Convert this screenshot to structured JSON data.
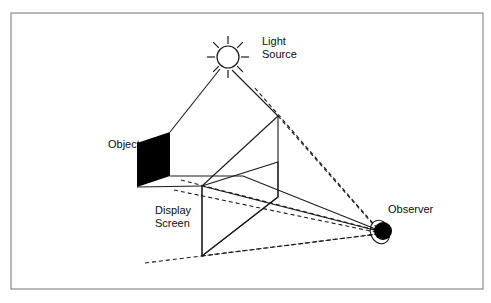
{
  "figure": {
    "background_color": "#ffffff",
    "border_color": "#8a8a8a",
    "line_color": "#1a1a1a",
    "fill_color": "#000000",
    "border": {
      "x": 11,
      "y": 13,
      "width": 472,
      "height": 276
    },
    "labels": {
      "light_source_line1": "Light",
      "light_source_line2": "Source",
      "object": "Object",
      "display_screen_line1": "Display",
      "display_screen_line2": "Screen",
      "observer": "Observer"
    },
    "elements": {
      "light_source": {
        "name": "sun-icon",
        "center_x": 228,
        "center_y": 57,
        "radius": 11,
        "ray_count": 8,
        "ray_inner": 13,
        "ray_outer": 21
      },
      "observer_eye": {
        "name": "observer-eye-icon",
        "pupil_cx": 383,
        "pupil_cy": 231,
        "pupil_r": 9,
        "ring_cx": 380,
        "ring_cy": 232,
        "ring_rx": 9.5,
        "ring_ry": 12
      },
      "object_panel": {
        "name": "object-panel",
        "points": "137,143 170,132 170,176 137,187"
      },
      "display_screen": {
        "name": "display-screen-outline",
        "points": "202,186 278,162 278,197 202,256"
      }
    },
    "solid_lines": [
      {
        "name": "light-ray-to-object",
        "x1": 220,
        "y1": 69,
        "x2": 170,
        "y2": 132
      },
      {
        "name": "light-ray-to-apex",
        "x1": 232,
        "y1": 70,
        "x2": 278,
        "y2": 116
      },
      {
        "name": "object-top-edge-to-screen",
        "x1": 170,
        "y1": 176,
        "x2": 243,
        "y2": 176
      },
      {
        "name": "object-bottom-edge-to-screen",
        "x1": 137,
        "y1": 187,
        "x2": 202,
        "y2": 186
      },
      {
        "name": "apex-vertical-edge",
        "x1": 278,
        "y1": 116,
        "x2": 278,
        "y2": 197
      },
      {
        "name": "screen-left-vertical-edge",
        "x1": 202,
        "y1": 186,
        "x2": 202,
        "y2": 256
      },
      {
        "name": "apex-to-screen-left-top",
        "x1": 278,
        "y1": 116,
        "x2": 202,
        "y2": 186
      },
      {
        "name": "apex-to-screen-bottom-left",
        "x1": 278,
        "y1": 197,
        "x2": 202,
        "y2": 256
      },
      {
        "name": "shadow-top-to-observer",
        "x1": 202,
        "y1": 186,
        "x2": 378,
        "y2": 231
      },
      {
        "name": "screen-top-edge-to-observer",
        "x1": 243,
        "y1": 176,
        "x2": 378,
        "y2": 230
      }
    ],
    "dashed_lines": [
      {
        "name": "sight-line-upper-to-observer",
        "x1": 255,
        "y1": 88,
        "x2": 378,
        "y2": 229
      },
      {
        "name": "sight-line-apex-to-observer",
        "x1": 278,
        "y1": 116,
        "x2": 378,
        "y2": 230
      },
      {
        "name": "ground-line-left-to-observer",
        "x1": 145,
        "y1": 263,
        "x2": 378,
        "y2": 234
      },
      {
        "name": "screen-plane-upper-guide",
        "x1": 181,
        "y1": 180,
        "x2": 380,
        "y2": 231
      },
      {
        "name": "screen-plane-lower-guide",
        "x1": 174,
        "y1": 190,
        "x2": 380,
        "y2": 233
      },
      {
        "name": "screen-bottom-left-guide",
        "x1": 202,
        "y1": 256,
        "x2": 378,
        "y2": 234
      }
    ],
    "label_positions": {
      "light_source": {
        "x": 262,
        "y": 45
      },
      "object": {
        "x": 108,
        "y": 148
      },
      "display_screen": {
        "x": 155,
        "y": 214
      },
      "observer": {
        "x": 388,
        "y": 213
      }
    }
  }
}
